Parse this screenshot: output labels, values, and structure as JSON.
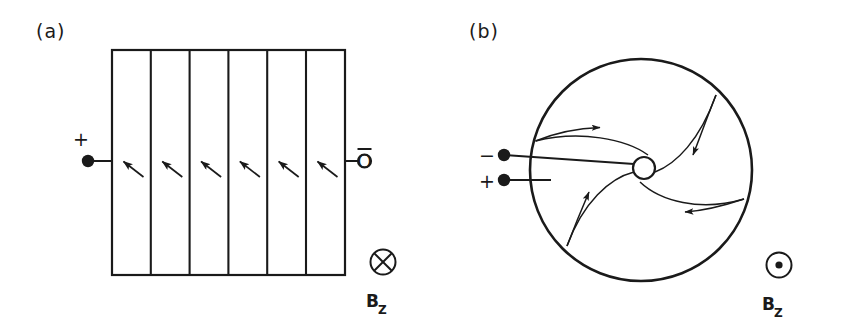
{
  "figure": {
    "background_color": "#ffffff",
    "ink_color": "#1a1a1a",
    "panels": [
      {
        "id": "a",
        "label": "(a)",
        "geometry": "rectangular-strip",
        "description": "Rectangular sample divided by five vertical lines into six equal segments, with six oblique current arrows along the mid-height row",
        "rect": {
          "x": 112,
          "y": 50,
          "width": 233,
          "height": 225
        },
        "divider_count": 5,
        "arrow_count": 6,
        "arrow_direction": "up-left",
        "terminals": [
          {
            "name": "left-terminal",
            "sign": "+",
            "marker": "filled-dot",
            "x": 88,
            "y": 161
          },
          {
            "name": "right-terminal",
            "sign": "−",
            "marker": "open-circle",
            "label": "O",
            "overbar": true,
            "x": 362,
            "y": 161
          }
        ],
        "field_symbol": {
          "name": "b-field-into-page",
          "glyph": "circle-with-cross",
          "cx": 383,
          "cy": 262,
          "r": 13
        },
        "field_label": {
          "base": "B",
          "subscript": "Z",
          "x": 372,
          "y": 305
        }
      },
      {
        "id": "b",
        "label": "(b)",
        "geometry": "corbino-disk",
        "description": "Circular Corbino disk with a small central hub and four logarithmic spiral current paths spiralling inward, each carrying an arrowhead",
        "outer_circle": {
          "cx": 641,
          "cy": 170,
          "r": 111
        },
        "hub_circle": {
          "cx": 644,
          "cy": 168,
          "r": 11
        },
        "spiral_count": 4,
        "spiral_direction": "inward-clockwise",
        "terminals": [
          {
            "name": "upper-terminal",
            "sign": "−",
            "marker": "filled-dot",
            "x": 504,
            "y": 155
          },
          {
            "name": "lower-terminal",
            "sign": "+",
            "marker": "filled-dot",
            "x": 504,
            "y": 180
          }
        ],
        "field_symbol": {
          "name": "b-field-out-of-page",
          "glyph": "circle-with-dot",
          "cx": 779,
          "cy": 265,
          "r": 13
        },
        "field_label": {
          "base": "B",
          "subscript": "Z",
          "x": 768,
          "y": 308
        }
      }
    ]
  }
}
